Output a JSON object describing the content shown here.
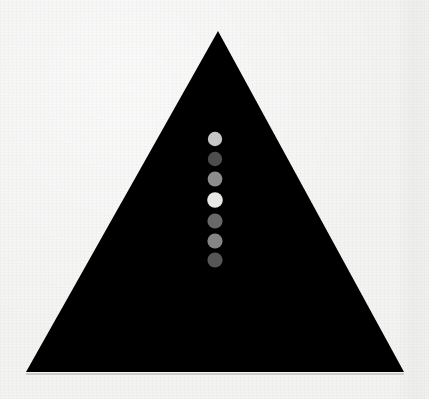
{
  "image": {
    "title": "Black triangle with vertical column of grayscale dots",
    "width": 429,
    "height": 399,
    "background_color": "#f3f3f2",
    "medium": "printed page photograph"
  },
  "shapes": {
    "triangle": {
      "name": "black-triangle",
      "fill_color": "#050505",
      "apex": {
        "x": 218,
        "y": 31
      },
      "bottom_left": {
        "x": 26,
        "y": 372
      },
      "bottom_right": {
        "x": 404,
        "y": 372
      },
      "points": "218,31 404,372 26,372"
    },
    "base_shadow": {
      "name": "triangle-base-shadow",
      "color": "#b9b9b9",
      "x1": 26,
      "x2": 404,
      "y": 374,
      "thickness": 1.6
    }
  },
  "dot_column": {
    "name": "grayscale-dot-column",
    "center_x": 215,
    "first_center_y": 139,
    "spacing": 19.8,
    "count": 7,
    "dots": [
      {
        "index": 1,
        "label": "dot-1",
        "cx": 215,
        "cy": 139,
        "r": 7.2,
        "color": "#c6c6c6",
        "gray_value": 198
      },
      {
        "index": 2,
        "label": "dot-2",
        "cx": 215,
        "cy": 159,
        "r": 7.2,
        "color": "#4e4e4e",
        "gray_value": 78
      },
      {
        "index": 3,
        "label": "dot-3",
        "cx": 215,
        "cy": 179,
        "r": 7.4,
        "color": "#8d8d8d",
        "gray_value": 141
      },
      {
        "index": 4,
        "label": "dot-4",
        "cx": 215,
        "cy": 200,
        "r": 7.8,
        "color": "#e8e8e6",
        "gray_value": 232
      },
      {
        "index": 5,
        "label": "dot-5",
        "cx": 215,
        "cy": 221,
        "r": 7.6,
        "color": "#676767",
        "gray_value": 103
      },
      {
        "index": 6,
        "label": "dot-6",
        "cx": 215,
        "cy": 241,
        "r": 7.6,
        "color": "#858585",
        "gray_value": 133
      },
      {
        "index": 7,
        "label": "dot-7",
        "cx": 215,
        "cy": 260,
        "r": 7.6,
        "color": "#565656",
        "gray_value": 86
      }
    ]
  }
}
